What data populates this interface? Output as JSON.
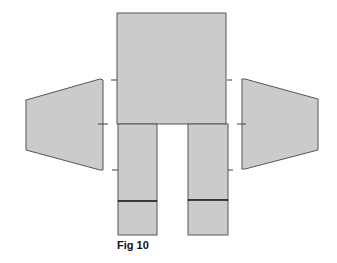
{
  "figure": {
    "caption": "Fig 10",
    "colors": {
      "fill": "#cbcbcb",
      "stroke": "#555555",
      "seam": "#222222",
      "tick": "#444444",
      "background": "#ffffff"
    },
    "pieces": [
      {
        "name": "body-panel",
        "shape": "rect",
        "x": 117,
        "y": 13,
        "w": 109,
        "h": 111
      },
      {
        "name": "left-leg-panel",
        "shape": "rect",
        "x": 118,
        "y": 124,
        "w": 39,
        "h": 77
      },
      {
        "name": "left-foot-panel",
        "shape": "rect",
        "x": 118,
        "y": 201,
        "w": 39,
        "h": 34
      },
      {
        "name": "right-leg-panel",
        "shape": "rect",
        "x": 188,
        "y": 124,
        "w": 40,
        "h": 76
      },
      {
        "name": "right-foot-panel",
        "shape": "rect",
        "x": 188,
        "y": 200,
        "w": 40,
        "h": 35
      },
      {
        "name": "left-wing-panel",
        "shape": "polygon",
        "points": "26,100 100,79 103,80 103,170 100,170 26,150"
      },
      {
        "name": "right-wing-panel",
        "shape": "polygon",
        "points": "242,79 245,79 318,99 318,150 245,169 242,169"
      }
    ],
    "ticks": [
      {
        "x1": 111,
        "y1": 80,
        "x2": 117,
        "y2": 80
      },
      {
        "x1": 98,
        "y1": 124,
        "x2": 108,
        "y2": 124
      },
      {
        "x1": 112,
        "y1": 170,
        "x2": 118,
        "y2": 170
      },
      {
        "x1": 227,
        "y1": 80,
        "x2": 232,
        "y2": 80
      },
      {
        "x1": 237,
        "y1": 124,
        "x2": 246,
        "y2": 124
      },
      {
        "x1": 228,
        "y1": 170,
        "x2": 233,
        "y2": 170
      }
    ]
  }
}
